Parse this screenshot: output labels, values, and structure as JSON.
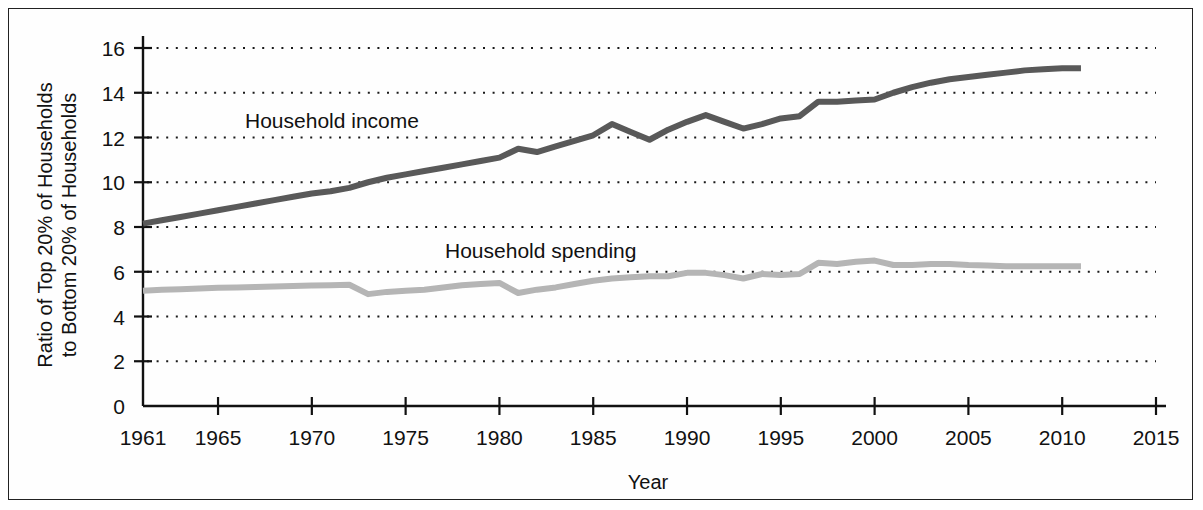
{
  "figure": {
    "background_color": "#ffffff",
    "border_color": "#222222"
  },
  "axes": {
    "x_title": "Year",
    "y_title_line1": "Ratio of Top 20% of Households",
    "y_title_line2": "to Bottom 20% of Households"
  },
  "labels": {
    "income": "Household income",
    "spending": "Household spending"
  },
  "ticks": {
    "x": [
      "1961",
      "1965",
      "1970",
      "1975",
      "1980",
      "1985",
      "1990",
      "1995",
      "2000",
      "2005",
      "2010",
      "2015"
    ],
    "y": [
      "0",
      "2",
      "4",
      "6",
      "8",
      "10",
      "12",
      "14",
      "16"
    ]
  },
  "chart_data": {
    "type": "line",
    "title": "",
    "subtitle": "",
    "xlabel": "Year",
    "ylabel": "Ratio of Top 20% of Households to Bottom 20% of Households",
    "xlim": [
      1961,
      2015
    ],
    "ylim": [
      0,
      16
    ],
    "x_ticks": [
      1961,
      1965,
      1970,
      1975,
      1980,
      1985,
      1990,
      1995,
      2000,
      2005,
      2010,
      2015
    ],
    "y_ticks": [
      0,
      2,
      4,
      6,
      8,
      10,
      12,
      14,
      16
    ],
    "grid": "horizontal-dotted",
    "legend": "inline-annotations",
    "x": [
      1961,
      1962,
      1963,
      1964,
      1965,
      1966,
      1967,
      1968,
      1969,
      1970,
      1971,
      1972,
      1973,
      1974,
      1975,
      1976,
      1977,
      1978,
      1979,
      1980,
      1981,
      1982,
      1983,
      1984,
      1985,
      1986,
      1987,
      1988,
      1989,
      1990,
      1991,
      1992,
      1993,
      1994,
      1995,
      1996,
      1997,
      1998,
      1999,
      2000,
      2001,
      2002,
      2003,
      2004,
      2005,
      2006,
      2007,
      2008,
      2009,
      2010,
      2011
    ],
    "series": [
      {
        "name": "Household income",
        "color": "#595959",
        "values": [
          8.15,
          8.3,
          8.45,
          8.6,
          8.75,
          8.9,
          9.05,
          9.2,
          9.35,
          9.5,
          9.6,
          9.75,
          10.0,
          10.2,
          10.35,
          10.5,
          10.65,
          10.8,
          10.95,
          11.1,
          11.5,
          11.35,
          11.6,
          11.85,
          12.1,
          12.6,
          12.25,
          11.9,
          12.35,
          12.7,
          13.0,
          12.7,
          12.4,
          12.6,
          12.85,
          12.95,
          13.6,
          13.6,
          13.65,
          13.7,
          14.0,
          14.25,
          14.45,
          14.6,
          14.7,
          14.8,
          14.9,
          15.0,
          15.05,
          15.1,
          15.1
        ]
      },
      {
        "name": "Household spending",
        "color": "#b5b5b5",
        "values": [
          5.15,
          5.2,
          5.22,
          5.25,
          5.28,
          5.3,
          5.32,
          5.34,
          5.36,
          5.38,
          5.4,
          5.42,
          5.0,
          5.1,
          5.15,
          5.2,
          5.3,
          5.4,
          5.45,
          5.5,
          5.05,
          5.2,
          5.3,
          5.45,
          5.6,
          5.7,
          5.75,
          5.8,
          5.8,
          5.95,
          5.95,
          5.85,
          5.7,
          5.9,
          5.85,
          5.9,
          6.4,
          6.35,
          6.45,
          6.5,
          6.3,
          6.3,
          6.35,
          6.35,
          6.3,
          6.28,
          6.25,
          6.25,
          6.25,
          6.25,
          6.25
        ]
      }
    ]
  }
}
